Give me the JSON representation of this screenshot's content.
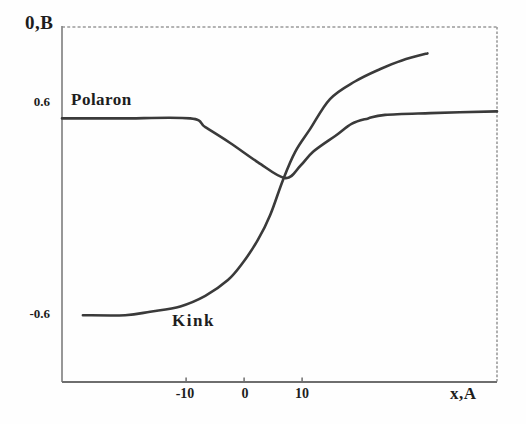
{
  "figure": {
    "y_axis_title": "0,B",
    "x_axis_title": "x,A",
    "y_tick_labels": {
      "top": "0.6",
      "bottom": "-0.6"
    },
    "x_tick_labels": [
      "-10",
      "0",
      "10"
    ]
  },
  "chart_data": {
    "type": "line",
    "title": "",
    "xlabel": "x,A",
    "ylabel": "0,B",
    "xlim": [
      -31.4,
      43.6
    ],
    "ylim": [
      -0.99,
      1.03
    ],
    "x_ticks": [
      -10,
      0,
      10
    ],
    "y_ticks": [
      0.6,
      -0.6
    ],
    "grid": false,
    "legend_position": "inline-curve-labels",
    "line_color": "#3a3a3a",
    "tick_color": "#6e6e6e",
    "series": [
      {
        "name": "Polaron",
        "x": [
          -31.4,
          -21.4,
          -9.3,
          -6.7,
          -2.4,
          2.4,
          7.1,
          9.7,
          11.9,
          15.7,
          18.6,
          21.4,
          24.3,
          32.1,
          43.6
        ],
        "y": [
          0.51,
          0.51,
          0.51,
          0.46,
          0.37,
          0.26,
          0.17,
          0.24,
          0.32,
          0.41,
          0.48,
          0.51,
          0.53,
          0.54,
          0.55
        ]
      },
      {
        "name": "Kink",
        "x": [
          -27.8,
          -20.5,
          -16.2,
          -11.0,
          -6.7,
          -2.8,
          -0.2,
          2.4,
          4.5,
          6.7,
          8.8,
          11.4,
          14.8,
          19.1,
          23.4,
          27.2,
          31.6
        ],
        "y": [
          -0.61,
          -0.61,
          -0.59,
          -0.56,
          -0.5,
          -0.41,
          -0.31,
          -0.18,
          -0.04,
          0.16,
          0.32,
          0.45,
          0.62,
          0.72,
          0.79,
          0.84,
          0.88
        ]
      }
    ]
  }
}
